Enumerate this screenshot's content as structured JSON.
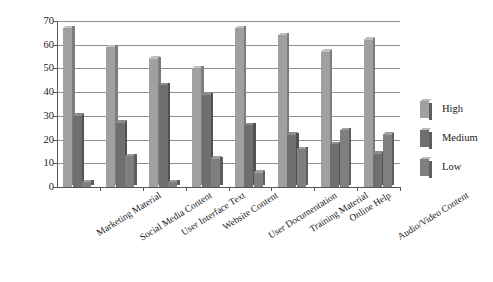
{
  "chart_data": {
    "type": "bar",
    "title": "",
    "xlabel": "",
    "ylabel": "",
    "ylim": [
      0,
      70
    ],
    "ytick_step": 10,
    "yticks": [
      "0",
      "10",
      "20",
      "30",
      "40",
      "50",
      "60",
      "70"
    ],
    "grid": true,
    "legend_position": "right",
    "categories": [
      "Marketing Material",
      "Social Media Content",
      "User Interface Text",
      "Website Content",
      "User Documentation",
      "Training Material",
      "Online Help",
      "Audio/Video Content"
    ],
    "series": [
      {
        "name": "High",
        "color": "#a0a0a0",
        "values": [
          67,
          59,
          54,
          50,
          67,
          64,
          57,
          62
        ]
      },
      {
        "name": "Medium",
        "color": "#6f6f6f",
        "values": [
          30,
          27,
          43,
          39,
          26,
          22,
          18,
          14
        ]
      },
      {
        "name": "Low",
        "color": "#7f7f7f",
        "values": [
          2,
          13,
          2,
          12,
          6,
          16,
          24,
          22
        ]
      }
    ]
  },
  "legend": {
    "items": [
      {
        "label": "High"
      },
      {
        "label": "Medium"
      },
      {
        "label": "Low"
      }
    ]
  },
  "caption": {
    "text": ""
  }
}
